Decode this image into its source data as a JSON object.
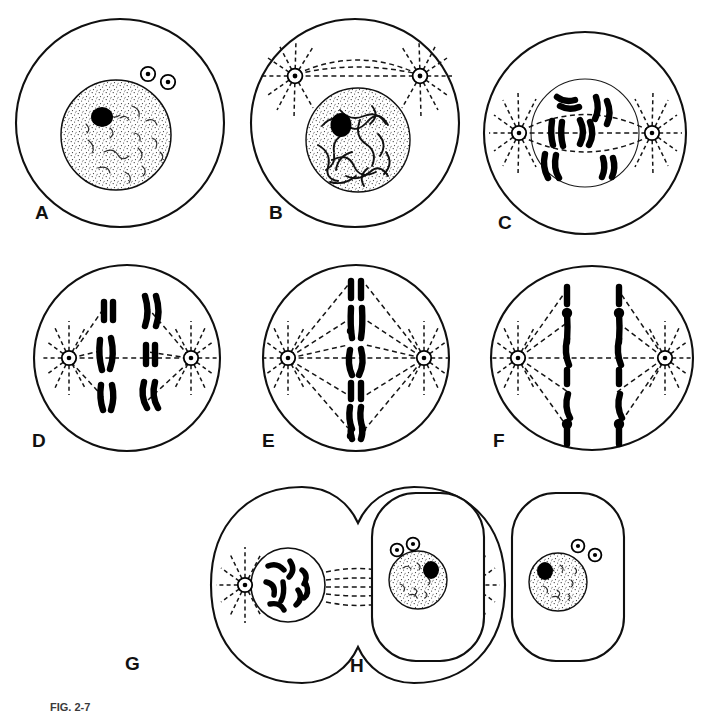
{
  "figure": {
    "style": "black-and-white line drawing",
    "background_color": "#ffffff",
    "ink_color": "#000000",
    "panel_count": 8,
    "layout": "3 panels in row 1, 3 panels in row 2, 2 panels in row 3",
    "caption_partial": "FIG. 2-7"
  },
  "panels": [
    {
      "letter": "A",
      "stage": "Interphase",
      "cell_shape": "circle",
      "nucleus": "present",
      "nucleolus_count": 1,
      "centriole_count": 2,
      "chromosome_count": 0,
      "spindle": "absent",
      "description": "Resting cell with intact nucleus showing stippled chromatin, a single dark nucleolus, and a pair of centrioles outside the nuclear envelope."
    },
    {
      "letter": "B",
      "stage": "Early prophase",
      "cell_shape": "circle",
      "nucleus": "present",
      "nucleolus_count": 1,
      "centriole_count": 2,
      "chromosome_count": 0,
      "spindle": "forming",
      "description": "Chromatin condenses into long tangled threads; centriole pair has split and migrates apart with asters and early spindle arcs."
    },
    {
      "letter": "C",
      "stage": "Late prophase",
      "cell_shape": "circle",
      "nucleus": "fading",
      "nucleolus_count": 0,
      "centriole_count": 2,
      "chromosome_count": 6,
      "spindle": "forming",
      "description": "Distinct doubled chromosomes appear inside the breaking-down nuclear envelope; asters reach opposite poles."
    },
    {
      "letter": "D",
      "stage": "Prometaphase",
      "cell_shape": "circle",
      "nucleus": "absent",
      "nucleolus_count": 0,
      "centriole_count": 2,
      "chromosome_count": 6,
      "spindle": "attached",
      "description": "Nuclear envelope has disappeared; chromosomes lie scattered in two loose groups as spindle fibers attach to centromeres."
    },
    {
      "letter": "E",
      "stage": "Metaphase",
      "cell_shape": "circle",
      "nucleus": "absent",
      "nucleolus_count": 0,
      "centriole_count": 2,
      "chromosome_count": 6,
      "spindle": "attached",
      "description": "All six doubled chromosomes line up in a single file on the equatorial metaphase plate between the two asters."
    },
    {
      "letter": "F",
      "stage": "Anaphase",
      "cell_shape": "oval",
      "nucleus": "absent",
      "nucleolus_count": 0,
      "centriole_count": 2,
      "chromosome_count": 12,
      "spindle": "attached",
      "description": "Sister chromatids have separated into two parallel columns that are drawn toward opposite poles; the cell begins to elongate."
    },
    {
      "letter": "G",
      "stage": "Telophase / cytokinesis",
      "cell_shape": "dumbbell with cleavage furrow",
      "nucleus": "reforming",
      "nucleolus_count": 0,
      "centriole_count": 2,
      "chromosome_count": 12,
      "spindle": "interzonal remnants",
      "description": "A cleavage furrow pinches the cell in two; chromosomes cluster inside two reforming daughter nuclei joined by interzonal fibers."
    },
    {
      "letter": "H",
      "stage": "Daughter cells (interphase)",
      "cell_shape": "two rounded rectangles",
      "nucleus": "present",
      "nucleolus_count": 1,
      "centriole_count": 2,
      "chromosome_count": 0,
      "spindle": "absent",
      "description": "Division is complete: two separate daughter cells, each with a stippled interphase nucleus, one nucleolus, and a pair of centrioles."
    }
  ],
  "legend": {
    "structures": [
      "cell membrane",
      "nuclear envelope",
      "nucleolus",
      "chromatin",
      "chromosome",
      "centriole",
      "aster",
      "spindle fiber",
      "cleavage furrow"
    ]
  }
}
